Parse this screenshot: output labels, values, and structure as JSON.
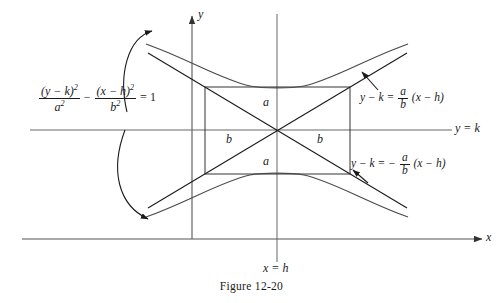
{
  "figure": {
    "caption": "Figure 12-20",
    "equation": {
      "numerator_left": "(y − k)",
      "numerator_left_exp": "2",
      "denominator_left": "a",
      "denominator_left_exp": "2",
      "operator": "−",
      "numerator_right": "(x − h)",
      "numerator_right_exp": "2",
      "denominator_right": "b",
      "denominator_right_exp": "2",
      "equals": "= 1",
      "plain": "(y − k)²/a² − (x − h)²/b² = 1"
    },
    "asymptotes": {
      "positive": {
        "lead": "y − k =",
        "frac_num": "a",
        "frac_den": "b",
        "tail": "(x − h)",
        "plain": "y − k = (a/b)(x − h)"
      },
      "negative": {
        "lead": "y − k = −",
        "frac_num": "a",
        "frac_den": "b",
        "tail": "(x − h)",
        "plain": "y − k = −(a/b)(x − h)"
      }
    },
    "axes": {
      "y_axis_label": "y",
      "x_axis_label": "x",
      "horizontal_line_label": "y = k",
      "vertical_line_label": "x = h"
    },
    "dimensions": {
      "semi_transverse_top": "a",
      "semi_transverse_bottom": "a",
      "semi_conjugate_left": "b",
      "semi_conjugate_right": "b"
    },
    "colors": {
      "ink": "#1a1a1a",
      "curve": "#4a4a4a",
      "axis": "#555555",
      "background": "#ffffff"
    }
  }
}
